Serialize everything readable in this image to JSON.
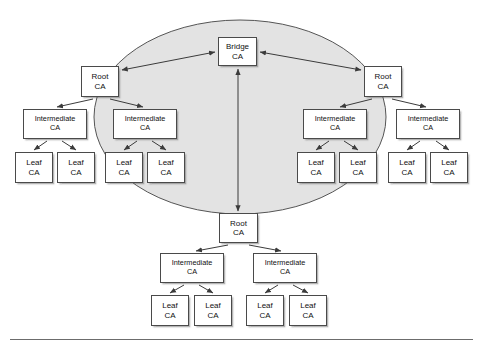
{
  "figure": {
    "type": "bridge-ca-trust-diagram",
    "colors": {
      "ellipse_fill": "#e3e3e3",
      "ellipse_stroke": "#555555",
      "box_fill": "#ffffff",
      "box_stroke": "#4a4a4a",
      "arrow_stroke": "#3b3b3b",
      "rule_color": "#6c6c6c",
      "text_color": "#111111"
    },
    "ellipse": {
      "cx": 240,
      "cy": 117,
      "rx": 146,
      "ry": 97
    },
    "labels": {
      "bridge": {
        "line1": "Bridge",
        "line2": "CA"
      },
      "root": {
        "line1": "Root",
        "line2": "CA"
      },
      "intermediate": {
        "line1": "Intermediate",
        "line2": "CA"
      },
      "leaf": {
        "line1": "Leaf",
        "line2": "CA"
      }
    },
    "nodes": [
      {
        "id": "bridge-ca",
        "kind": "bridge",
        "line1": "Bridge",
        "line2": "CA",
        "x": 218,
        "y": 37,
        "w": 39,
        "h": 29
      },
      {
        "id": "root-ca-left",
        "kind": "root",
        "line1": "Root",
        "line2": "CA",
        "x": 81,
        "y": 66,
        "w": 38,
        "h": 31
      },
      {
        "id": "root-ca-right",
        "kind": "root",
        "line1": "Root",
        "line2": "CA",
        "x": 364,
        "y": 66,
        "w": 38,
        "h": 31
      },
      {
        "id": "root-ca-bottom",
        "kind": "root",
        "line1": "Root",
        "line2": "CA",
        "x": 219,
        "y": 213,
        "w": 39,
        "h": 30
      },
      {
        "id": "inter-l1",
        "kind": "inter",
        "line1": "Intermediate",
        "line2": "CA",
        "x": 23,
        "y": 109,
        "w": 64,
        "h": 30
      },
      {
        "id": "inter-l2",
        "kind": "inter",
        "line1": "Intermediate",
        "line2": "CA",
        "x": 113,
        "y": 109,
        "w": 64,
        "h": 30
      },
      {
        "id": "inter-r1",
        "kind": "inter",
        "line1": "Intermediate",
        "line2": "CA",
        "x": 303,
        "y": 109,
        "w": 64,
        "h": 30
      },
      {
        "id": "inter-r2",
        "kind": "inter",
        "line1": "Intermediate",
        "line2": "CA",
        "x": 396,
        "y": 109,
        "w": 64,
        "h": 30
      },
      {
        "id": "leaf-l1",
        "kind": "leaf",
        "line1": "Leaf",
        "line2": "CA",
        "x": 15,
        "y": 152,
        "w": 38,
        "h": 31
      },
      {
        "id": "leaf-l2",
        "kind": "leaf",
        "line1": "Leaf",
        "line2": "CA",
        "x": 57,
        "y": 152,
        "w": 38,
        "h": 31
      },
      {
        "id": "leaf-l3",
        "kind": "leaf",
        "line1": "Leaf",
        "line2": "CA",
        "x": 105,
        "y": 152,
        "w": 38,
        "h": 31
      },
      {
        "id": "leaf-l4",
        "kind": "leaf",
        "line1": "Leaf",
        "line2": "CA",
        "x": 147,
        "y": 152,
        "w": 38,
        "h": 31
      },
      {
        "id": "leaf-r1",
        "kind": "leaf",
        "line1": "Leaf",
        "line2": "CA",
        "x": 297,
        "y": 152,
        "w": 38,
        "h": 31
      },
      {
        "id": "leaf-r2",
        "kind": "leaf",
        "line1": "Leaf",
        "line2": "CA",
        "x": 339,
        "y": 152,
        "w": 38,
        "h": 31
      },
      {
        "id": "leaf-r3",
        "kind": "leaf",
        "line1": "Leaf",
        "line2": "CA",
        "x": 388,
        "y": 152,
        "w": 38,
        "h": 31
      },
      {
        "id": "leaf-r4",
        "kind": "leaf",
        "line1": "Leaf",
        "line2": "CA",
        "x": 430,
        "y": 152,
        "w": 38,
        "h": 31
      },
      {
        "id": "inter-b1",
        "kind": "inter",
        "line1": "Intermediate",
        "line2": "CA",
        "x": 160,
        "y": 253,
        "w": 64,
        "h": 30
      },
      {
        "id": "inter-b2",
        "kind": "inter",
        "line1": "Intermediate",
        "line2": "CA",
        "x": 253,
        "y": 253,
        "w": 64,
        "h": 30
      },
      {
        "id": "leaf-b1",
        "kind": "leaf",
        "line1": "Leaf",
        "line2": "CA",
        "x": 151,
        "y": 295,
        "w": 38,
        "h": 31
      },
      {
        "id": "leaf-b2",
        "kind": "leaf",
        "line1": "Leaf",
        "line2": "CA",
        "x": 194,
        "y": 295,
        "w": 38,
        "h": 31
      },
      {
        "id": "leaf-b3",
        "kind": "leaf",
        "line1": "Leaf",
        "line2": "CA",
        "x": 246,
        "y": 295,
        "w": 38,
        "h": 31
      },
      {
        "id": "leaf-b4",
        "kind": "leaf",
        "line1": "Leaf",
        "line2": "CA",
        "x": 289,
        "y": 295,
        "w": 38,
        "h": 31
      }
    ],
    "edges": [
      {
        "id": "bridge-rootleft",
        "from": "root-ca-left",
        "to": "bridge-ca",
        "arrows": "both",
        "x1": 122,
        "y1": 70,
        "x2": 215,
        "y2": 52
      },
      {
        "id": "bridge-rootright",
        "from": "root-ca-right",
        "to": "bridge-ca",
        "arrows": "both",
        "x1": 361,
        "y1": 70,
        "x2": 260,
        "y2": 52
      },
      {
        "id": "bridge-rootbottom",
        "from": "root-ca-bottom",
        "to": "bridge-ca",
        "arrows": "both",
        "x1": 238,
        "y1": 211,
        "x2": 238,
        "y2": 69
      },
      {
        "id": "rootleft-interl1",
        "from": "root-ca-left",
        "to": "inter-l1",
        "arrows": "end",
        "x1": 93,
        "y1": 99,
        "x2": 57,
        "y2": 107
      },
      {
        "id": "rootleft-interl2",
        "from": "root-ca-left",
        "to": "inter-l2",
        "arrows": "end",
        "x1": 110,
        "y1": 99,
        "x2": 143,
        "y2": 107
      },
      {
        "id": "rootright-interr1",
        "from": "root-ca-right",
        "to": "inter-r1",
        "arrows": "end",
        "x1": 372,
        "y1": 99,
        "x2": 340,
        "y2": 107
      },
      {
        "id": "rootright-interr2",
        "from": "root-ca-right",
        "to": "inter-r2",
        "arrows": "end",
        "x1": 392,
        "y1": 99,
        "x2": 426,
        "y2": 107
      },
      {
        "id": "interl1-leafl1",
        "from": "inter-l1",
        "to": "leaf-l1",
        "arrows": "end",
        "x1": 47,
        "y1": 141,
        "x2": 34,
        "y2": 150
      },
      {
        "id": "interl1-leafl2",
        "from": "inter-l1",
        "to": "leaf-l2",
        "arrows": "end",
        "x1": 62,
        "y1": 141,
        "x2": 76,
        "y2": 150
      },
      {
        "id": "interl2-leafl3",
        "from": "inter-l2",
        "to": "leaf-l3",
        "arrows": "end",
        "x1": 137,
        "y1": 141,
        "x2": 124,
        "y2": 150
      },
      {
        "id": "interl2-leafl4",
        "from": "inter-l2",
        "to": "leaf-l4",
        "arrows": "end",
        "x1": 152,
        "y1": 141,
        "x2": 166,
        "y2": 150
      },
      {
        "id": "interr1-leafr1",
        "from": "inter-r1",
        "to": "leaf-r1",
        "arrows": "end",
        "x1": 329,
        "y1": 141,
        "x2": 316,
        "y2": 150
      },
      {
        "id": "interr1-leafr2",
        "from": "inter-r1",
        "to": "leaf-r2",
        "arrows": "end",
        "x1": 344,
        "y1": 141,
        "x2": 358,
        "y2": 150
      },
      {
        "id": "interr2-leafr3",
        "from": "inter-r2",
        "to": "leaf-r3",
        "arrows": "end",
        "x1": 420,
        "y1": 141,
        "x2": 407,
        "y2": 150
      },
      {
        "id": "interr2-leafr4",
        "from": "inter-r2",
        "to": "leaf-r4",
        "arrows": "end",
        "x1": 436,
        "y1": 141,
        "x2": 449,
        "y2": 150
      },
      {
        "id": "rootbottom-interb1",
        "from": "root-ca-bottom",
        "to": "inter-b1",
        "arrows": "end",
        "x1": 228,
        "y1": 245,
        "x2": 196,
        "y2": 251
      },
      {
        "id": "rootbottom-interb2",
        "from": "root-ca-bottom",
        "to": "inter-b2",
        "arrows": "end",
        "x1": 249,
        "y1": 245,
        "x2": 281,
        "y2": 251
      },
      {
        "id": "interb1-leafb1",
        "from": "inter-b1",
        "to": "leaf-b1",
        "arrows": "end",
        "x1": 184,
        "y1": 285,
        "x2": 170,
        "y2": 293
      },
      {
        "id": "interb1-leafb2",
        "from": "inter-b1",
        "to": "leaf-b2",
        "arrows": "end",
        "x1": 199,
        "y1": 285,
        "x2": 213,
        "y2": 293
      },
      {
        "id": "interb2-leafb3",
        "from": "inter-b2",
        "to": "leaf-b3",
        "arrows": "end",
        "x1": 278,
        "y1": 285,
        "x2": 265,
        "y2": 293
      },
      {
        "id": "interb2-leafb4",
        "from": "inter-b2",
        "to": "leaf-b4",
        "arrows": "end",
        "x1": 293,
        "y1": 285,
        "x2": 308,
        "y2": 293
      }
    ]
  }
}
